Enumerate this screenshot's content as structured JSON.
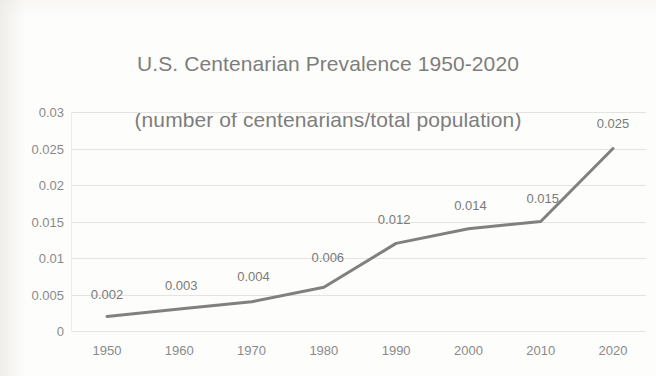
{
  "chart_data": {
    "type": "line",
    "title": "U.S. Centenarian Prevalence 1950-2020\n(number of centenarians/total population)",
    "title_line1": "U.S. Centenarian Prevalence 1950-2020",
    "title_line2": "(number of centenarians/total population)",
    "xlabel": "",
    "ylabel": "",
    "categories": [
      "1950",
      "1960",
      "1970",
      "1980",
      "1990",
      "2000",
      "2010",
      "2020"
    ],
    "x": [
      1950,
      1960,
      1970,
      1980,
      1990,
      2000,
      2010,
      2020
    ],
    "values": [
      0.002,
      0.003,
      0.004,
      0.006,
      0.012,
      0.014,
      0.015,
      0.025
    ],
    "point_labels": [
      "0.002",
      "0.003",
      "0.004",
      "0.006",
      "0.012",
      "0.014",
      "0.015",
      "0.025"
    ],
    "ylim": [
      0,
      0.03
    ],
    "ytick_values": [
      0,
      0.005,
      0.01,
      0.015,
      0.02,
      0.025,
      0.03
    ],
    "ytick_labels": [
      "0",
      "0.005",
      "0.01",
      "0.015",
      "0.02",
      "0.025",
      "0.03"
    ],
    "grid": true,
    "grid_axis": "y",
    "legend": false,
    "legend_position": "none",
    "series": [
      {
        "name": "U.S. Centenarian Prevalence",
        "values": [
          0.002,
          0.003,
          0.004,
          0.006,
          0.012,
          0.014,
          0.015,
          0.025
        ],
        "color": "#808080",
        "line_width": 3,
        "markers": false,
        "data_labels": true
      }
    ],
    "colors": {
      "line": "#808080",
      "grid": "#e4e3df",
      "text": "#8a8a8a",
      "title": "#7d7d7d",
      "background": "#fdfdfb"
    }
  }
}
